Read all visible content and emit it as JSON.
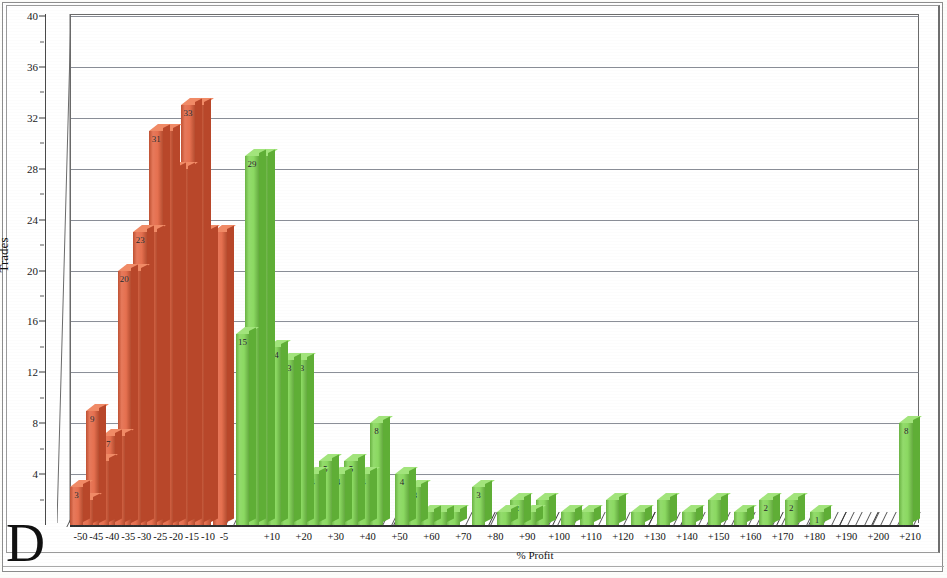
{
  "figure": {
    "corner_letter": "D",
    "frame_color": "#8d8d8d"
  },
  "chart_data": {
    "type": "bar",
    "title": "",
    "subtitle": "",
    "xlabel": "% Profit",
    "ylabel": "Trades",
    "ylim": [
      0,
      40
    ],
    "ytick_step": 4,
    "yticks": [
      4,
      8,
      12,
      16,
      20,
      24,
      28,
      32,
      36,
      40
    ],
    "ytick_labels": [
      "4",
      "8",
      "12",
      "16",
      "20",
      "24",
      "28",
      "32",
      "36",
      "40"
    ],
    "grid": true,
    "grid_axis": "y",
    "legend": null,
    "colors": {
      "loss": "#e2603c",
      "profit": "#7ed450",
      "loss_top": "#f08a66",
      "profit_top": "#a2e47c",
      "grid": "#777b86",
      "axis": "#2f2f2f"
    },
    "xtick_labels": [
      "-50",
      "-45",
      "-40",
      "-35",
      "-30",
      "-25",
      "-20",
      "-15",
      "-10",
      "-5",
      "+10",
      "+20",
      "+30",
      "+40",
      "+50",
      "+60",
      "+70",
      "+80",
      "+90",
      "+100",
      "+110",
      "+120",
      "+130",
      "+140",
      "+150",
      "+160",
      "+170",
      "+180",
      "+190",
      "+200",
      "+210"
    ],
    "categories": [
      "-50",
      "-45",
      "-40",
      "-35",
      "-30",
      "-25",
      "-20",
      "-15",
      "-10",
      "-5",
      "+5",
      "+10",
      "+15",
      "+20",
      "+25",
      "+30",
      "+35",
      "+40",
      "+45",
      "+50",
      "+55",
      "+60",
      "+65",
      "+70",
      "+75",
      "+80",
      "+85",
      "+90",
      "+95",
      "+100",
      "+105",
      "+110",
      "+115",
      "+120",
      "+125",
      "+130",
      "+135",
      "+140",
      "+145",
      "+150",
      "+155",
      "+160",
      "+165",
      "+170",
      "+175",
      "+180",
      "+185",
      "+190",
      "+195",
      "+200",
      "+205",
      "+210"
    ],
    "bars": [
      {
        "x": "-50",
        "value": 3,
        "group": "loss",
        "label": "3"
      },
      {
        "x": "-47",
        "value": 2,
        "group": "loss",
        "label": ""
      },
      {
        "x": "-45",
        "value": 9,
        "group": "loss",
        "label": "9"
      },
      {
        "x": "-42",
        "value": 5,
        "group": "loss",
        "label": "5"
      },
      {
        "x": "-40",
        "value": 7,
        "group": "loss",
        "label": "7"
      },
      {
        "x": "-37",
        "value": 7,
        "group": "loss",
        "label": ""
      },
      {
        "x": "-35",
        "value": 20,
        "group": "loss",
        "label": "20"
      },
      {
        "x": "-32",
        "value": 20,
        "group": "loss",
        "label": ""
      },
      {
        "x": "-30",
        "value": 23,
        "group": "loss",
        "label": "23"
      },
      {
        "x": "-27",
        "value": 23,
        "group": "loss",
        "label": ""
      },
      {
        "x": "-25",
        "value": 31,
        "group": "loss",
        "label": "31"
      },
      {
        "x": "-22",
        "value": 31,
        "group": "loss",
        "label": ""
      },
      {
        "x": "-20",
        "value": 28,
        "group": "loss",
        "label": "28"
      },
      {
        "x": "-17",
        "value": 28,
        "group": "loss",
        "label": ""
      },
      {
        "x": "-15",
        "value": 33,
        "group": "loss",
        "label": "33"
      },
      {
        "x": "-12",
        "value": 33,
        "group": "loss",
        "label": ""
      },
      {
        "x": "-10",
        "value": 23,
        "group": "loss",
        "label": "23"
      },
      {
        "x": "-5",
        "value": 23,
        "group": "loss",
        "label": ""
      },
      {
        "x": "+2",
        "value": 15,
        "group": "profit",
        "label": "15"
      },
      {
        "x": "+5",
        "value": 29,
        "group": "profit",
        "label": "29"
      },
      {
        "x": "+8",
        "value": 29,
        "group": "profit",
        "label": ""
      },
      {
        "x": "+12",
        "value": 14,
        "group": "profit",
        "label": "14"
      },
      {
        "x": "+16",
        "value": 13,
        "group": "profit",
        "label": "13"
      },
      {
        "x": "+20",
        "value": 13,
        "group": "profit",
        "label": "13"
      },
      {
        "x": "+24",
        "value": 4,
        "group": "profit",
        "label": "4"
      },
      {
        "x": "+28",
        "value": 5,
        "group": "profit",
        "label": "5"
      },
      {
        "x": "+32",
        "value": 4,
        "group": "profit",
        "label": "4"
      },
      {
        "x": "+36",
        "value": 5,
        "group": "profit",
        "label": "5"
      },
      {
        "x": "+40",
        "value": 4,
        "group": "profit",
        "label": "4"
      },
      {
        "x": "+44",
        "value": 8,
        "group": "profit",
        "label": "8"
      },
      {
        "x": "+52",
        "value": 4,
        "group": "profit",
        "label": "4"
      },
      {
        "x": "+56",
        "value": 3,
        "group": "profit",
        "label": "3"
      },
      {
        "x": "+60",
        "value": 1,
        "group": "profit",
        "label": ""
      },
      {
        "x": "+64",
        "value": 1,
        "group": "profit",
        "label": ""
      },
      {
        "x": "+68",
        "value": 1,
        "group": "profit",
        "label": ""
      },
      {
        "x": "+76",
        "value": 3,
        "group": "profit",
        "label": "3"
      },
      {
        "x": "+84",
        "value": 1,
        "group": "profit",
        "label": ""
      },
      {
        "x": "+88",
        "value": 2,
        "group": "profit",
        "label": "2"
      },
      {
        "x": "+92",
        "value": 1,
        "group": "profit",
        "label": ""
      },
      {
        "x": "+96",
        "value": 2,
        "group": "profit",
        "label": ""
      },
      {
        "x": "+104",
        "value": 1,
        "group": "profit",
        "label": ""
      },
      {
        "x": "+110",
        "value": 1,
        "group": "profit",
        "label": ""
      },
      {
        "x": "+118",
        "value": 2,
        "group": "profit",
        "label": ""
      },
      {
        "x": "+126",
        "value": 1,
        "group": "profit",
        "label": ""
      },
      {
        "x": "+134",
        "value": 2,
        "group": "profit",
        "label": ""
      },
      {
        "x": "+142",
        "value": 1,
        "group": "profit",
        "label": ""
      },
      {
        "x": "+150",
        "value": 2,
        "group": "profit",
        "label": ""
      },
      {
        "x": "+158",
        "value": 1,
        "group": "profit",
        "label": ""
      },
      {
        "x": "+166",
        "value": 2,
        "group": "profit",
        "label": "2"
      },
      {
        "x": "+174",
        "value": 2,
        "group": "profit",
        "label": "2"
      },
      {
        "x": "+182",
        "value": 1,
        "group": "profit",
        "label": "1"
      },
      {
        "x": "+210",
        "value": 8,
        "group": "profit",
        "label": "8"
      }
    ]
  }
}
